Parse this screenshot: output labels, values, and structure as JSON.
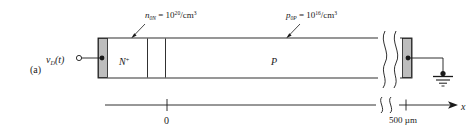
{
  "figure": {
    "panel_label": "(a)",
    "colors": {
      "line": "#1a1a1a",
      "contact_fill": "#bdbdbd",
      "body_fill": "#ffffff",
      "background": "#ffffff"
    }
  },
  "device": {
    "source_terminal": {
      "label_v": "v",
      "label_sub": "D",
      "label_paren": "(t)",
      "name": "vD(t)"
    },
    "regions": [
      {
        "name": "n-plus-region",
        "symbol": "N",
        "superscript": "+"
      },
      {
        "name": "p-region",
        "symbol": "P",
        "superscript": ""
      }
    ],
    "annotations": [
      {
        "name": "donor-concentration",
        "var": "n",
        "var_sub": "0N",
        "equals": " = 10",
        "exp": "20",
        "units": "/cm",
        "units_exp": "3"
      },
      {
        "name": "acceptor-concentration",
        "var": "p",
        "var_sub": "0P",
        "equals": " = 10",
        "exp": "16",
        "units": "/cm",
        "units_exp": "3"
      }
    ],
    "ground": {
      "name": "ground-symbol"
    },
    "break_symbol": {
      "name": "device-break-symbol"
    }
  },
  "axis": {
    "name": "x-axis",
    "label": "x",
    "ticks": [
      {
        "name": "tick-zero",
        "label": "0"
      },
      {
        "name": "tick-500um",
        "label": "500 µm"
      }
    ],
    "break_symbol": {
      "name": "axis-break-symbol"
    }
  }
}
